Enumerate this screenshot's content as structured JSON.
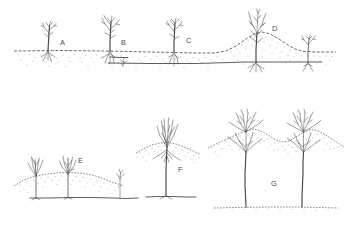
{
  "figure": {
    "background_color": "#ffffff",
    "ink_color": "#55514e",
    "soil_color": "#6d6862",
    "width": 348,
    "height": 229
  },
  "panels": [
    {
      "id": "A",
      "label": "A",
      "label_x": 60,
      "label_y": 45,
      "caption": "Young seedling at grade on flat dotted soil line",
      "stem_x": 48,
      "ground_y": 51,
      "row": "top"
    },
    {
      "id": "B",
      "label": "B",
      "label_x": 121,
      "label_y": 45,
      "caption": "Sapling with first lateral root visible at soil surface",
      "stem_x": 110,
      "ground_y": 51,
      "row": "top"
    },
    {
      "id": "C",
      "label": "C",
      "label_x": 186,
      "label_y": 43,
      "caption": "Sapling with root collar beginning to rise above grade",
      "stem_x": 174,
      "ground_y": 51,
      "row": "top"
    },
    {
      "id": "D",
      "label": "D",
      "label_x": 272,
      "label_y": 31,
      "caption": "Tree on built-up soil mound with lateral root running to a second shoot",
      "stem_x": 256,
      "ground_y": 55,
      "row": "top"
    },
    {
      "id": "E",
      "label": "E",
      "label_x": 78,
      "label_y": 163,
      "caption": "Two clumps on a low broad mound with exposed root plate",
      "stem_x": 66,
      "ground_y": 181,
      "row": "bottom"
    },
    {
      "id": "F",
      "label": "F",
      "label_x": 178,
      "label_y": 172,
      "caption": "Tree raised on stilt roots above an eroded mound",
      "stem_x": 166,
      "ground_y": 196,
      "row": "bottom"
    },
    {
      "id": "G",
      "label": "G",
      "label_x": 271,
      "label_y": 186,
      "caption": "Two mature trees on tall hummocks with long exposed stilt trunks",
      "stem_x": 253,
      "ground_y": 207,
      "row": "bottom"
    }
  ],
  "ground_lines": [
    {
      "name": "top-row-soil-surface",
      "style": "dashed-dotted"
    },
    {
      "name": "top-row-subsurface-root-line",
      "style": "solid"
    },
    {
      "name": "panel-e-mound-surface",
      "style": "dotted"
    },
    {
      "name": "panel-e-root-line",
      "style": "solid"
    },
    {
      "name": "panel-f-mound-surface",
      "style": "dotted"
    },
    {
      "name": "panel-f-root-line",
      "style": "solid"
    },
    {
      "name": "panel-g-base-ground-line",
      "style": "dotted"
    }
  ]
}
